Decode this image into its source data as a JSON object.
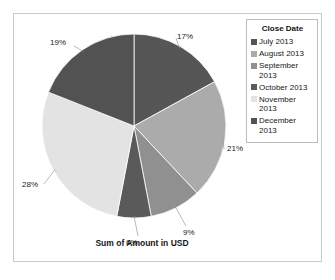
{
  "chart_data": {
    "type": "pie",
    "title": "Sum of Amount in USD",
    "legend_title": "Close Date",
    "legend_position": "right",
    "grid": false,
    "value_unit": "percent",
    "categories": [
      "July 2013",
      "August 2013",
      "September 2013",
      "October 2013",
      "November 2013",
      "December 2013"
    ],
    "values": [
      17,
      21,
      9,
      6,
      28,
      19
    ],
    "data_labels": [
      "17%",
      "21%",
      "9%",
      "6%",
      "28%",
      "19%"
    ],
    "colors": [
      "#565656",
      "#ababab",
      "#909090",
      "#5a5a5a",
      "#e3e3e3",
      "#525252"
    ],
    "slices": [
      {
        "label": "July 2013",
        "value": 17,
        "display": "17%",
        "color": "#565656"
      },
      {
        "label": "August 2013",
        "value": 21,
        "display": "21%",
        "color": "#ababab"
      },
      {
        "label": "September 2013",
        "value": 9,
        "display": "9%",
        "color": "#909090"
      },
      {
        "label": "October 2013",
        "value": 6,
        "display": "6%",
        "color": "#5a5a5a"
      },
      {
        "label": "November 2013",
        "value": 28,
        "display": "28%",
        "color": "#e3e3e3"
      },
      {
        "label": "December 2013",
        "value": 19,
        "display": "19%",
        "color": "#525252"
      }
    ]
  },
  "legend": {
    "title": "Close Date",
    "items": [
      {
        "label": "July 2013",
        "color": "#565656"
      },
      {
        "label": "August 2013",
        "color": "#ababab"
      },
      {
        "label": "September 2013",
        "color": "#909090"
      },
      {
        "label": "October 2013",
        "color": "#5a5a5a"
      },
      {
        "label": "November 2013",
        "color": "#e3e3e3"
      },
      {
        "label": "December 2013",
        "color": "#525252"
      }
    ]
  },
  "title": {
    "text": "Sum of Amount in USD"
  }
}
